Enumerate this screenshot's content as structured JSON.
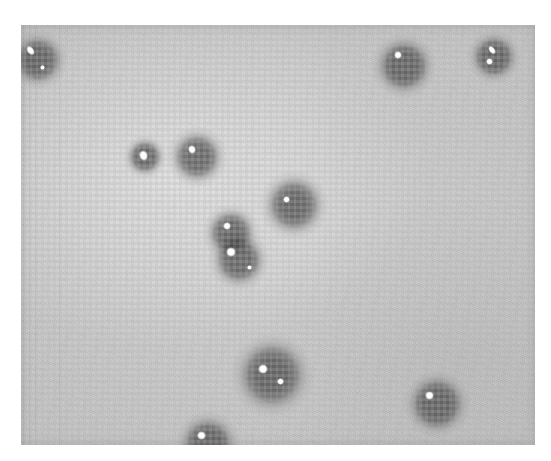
{
  "page": {
    "background_color": "#ffffff",
    "width": 551,
    "height": 461,
    "caption": ""
  },
  "plate": {
    "label": "photographic-plate",
    "description": "Scanned halftone photographic plate showing diffuse dark circular spots with bright specular highlights on a light grey grainy background",
    "frame": {
      "x": 21,
      "y": 25,
      "width": 514,
      "height": 420
    },
    "background_color": "#c6c6c6",
    "spot_color": "#2b2b2b",
    "highlight_color": "#ffffff",
    "texture": "halftone-grain"
  },
  "chart_data": {
    "type": "scatter",
    "title": "",
    "xlabel": "",
    "ylabel": "",
    "xlim": [
      21,
      535
    ],
    "ylim": [
      25,
      445
    ],
    "grid": false,
    "legend": null,
    "note": "Positions and sizes of dark spots measured in screenshot pixel coordinates; r = outer halo radius in px",
    "points": [
      {
        "id": 1,
        "x": 38,
        "y": 60,
        "r": 30,
        "label": "spot-top-left-edge",
        "highlights": [
          {
            "dx": -8,
            "dy": -10,
            "w": 7,
            "h": 11,
            "angle": -38
          },
          {
            "dx": 4,
            "dy": 7,
            "w": 5,
            "h": 5,
            "angle": 0
          }
        ]
      },
      {
        "id": 2,
        "x": 404,
        "y": 66,
        "r": 33,
        "label": "spot-top-right",
        "highlights": [
          {
            "dx": -6,
            "dy": -11,
            "w": 8,
            "h": 8,
            "angle": 0
          }
        ]
      },
      {
        "id": 3,
        "x": 494,
        "y": 57,
        "r": 27,
        "label": "spot-top-far-right",
        "highlights": [
          {
            "dx": -2,
            "dy": -7,
            "w": 6,
            "h": 10,
            "angle": -40
          },
          {
            "dx": -5,
            "dy": 4,
            "w": 7,
            "h": 7,
            "angle": 0
          }
        ]
      },
      {
        "id": 4,
        "x": 145,
        "y": 157,
        "r": 22,
        "label": "spot-mid-left-small",
        "highlights": [
          {
            "dx": -2,
            "dy": -2,
            "w": 9,
            "h": 11,
            "angle": -20
          }
        ]
      },
      {
        "id": 5,
        "x": 197,
        "y": 157,
        "r": 31,
        "label": "spot-mid-left-large",
        "highlights": [
          {
            "dx": -5,
            "dy": -8,
            "w": 8,
            "h": 9,
            "angle": -25
          }
        ]
      },
      {
        "id": 6,
        "x": 294,
        "y": 205,
        "r": 35,
        "label": "spot-center-upper",
        "highlights": [
          {
            "dx": -8,
            "dy": -6,
            "w": 7,
            "h": 7,
            "angle": 0
          }
        ]
      },
      {
        "id": 7,
        "x": 231,
        "y": 233,
        "r": 29,
        "label": "spot-center-pair-top",
        "highlights": [
          {
            "dx": -4,
            "dy": -7,
            "w": 8,
            "h": 8,
            "angle": 0
          }
        ]
      },
      {
        "id": 8,
        "x": 239,
        "y": 260,
        "r": 31,
        "label": "spot-center-pair-bottom",
        "highlights": [
          {
            "dx": -8,
            "dy": -8,
            "w": 10,
            "h": 10,
            "angle": 0
          },
          {
            "dx": 10,
            "dy": 7,
            "w": 5,
            "h": 5,
            "angle": 0
          }
        ]
      },
      {
        "id": 9,
        "x": 272,
        "y": 375,
        "r": 42,
        "label": "spot-bottom-center",
        "highlights": [
          {
            "dx": -9,
            "dy": -6,
            "w": 10,
            "h": 10,
            "angle": 0
          },
          {
            "dx": 8,
            "dy": 6,
            "w": 7,
            "h": 7,
            "angle": 0
          }
        ]
      },
      {
        "id": 10,
        "x": 208,
        "y": 444,
        "r": 33,
        "label": "spot-bottom-edge",
        "highlights": [
          {
            "dx": -7,
            "dy": -9,
            "w": 9,
            "h": 9,
            "angle": 0
          },
          {
            "dx": 9,
            "dy": 4,
            "w": 5,
            "h": 5,
            "angle": 0
          }
        ]
      },
      {
        "id": 11,
        "x": 437,
        "y": 404,
        "r": 34,
        "label": "spot-bottom-right",
        "highlights": [
          {
            "dx": -8,
            "dy": -9,
            "w": 9,
            "h": 9,
            "angle": 0
          }
        ]
      }
    ]
  }
}
